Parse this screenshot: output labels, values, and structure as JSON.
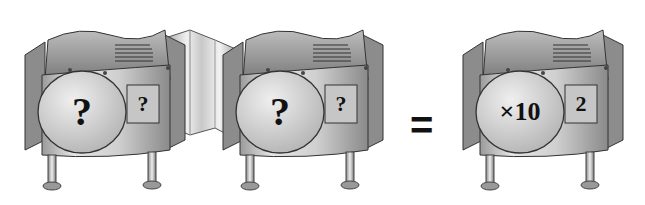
{
  "diagram": {
    "machines": [
      {
        "id": "machine-1",
        "dial_label": "?",
        "box_label": "?"
      },
      {
        "id": "machine-2",
        "dial_label": "?",
        "box_label": "?"
      },
      {
        "id": "result-machine",
        "dial_label": "×10",
        "box_label": "2"
      }
    ],
    "connector": "accordion-bellows",
    "operator": "="
  }
}
